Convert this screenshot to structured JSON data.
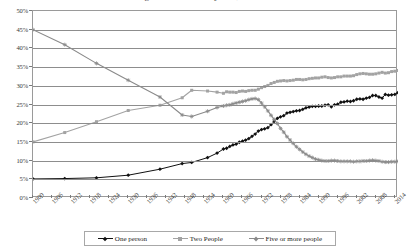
{
  "chart_data": {
    "type": "line",
    "title": "Percentage of Households by Size, United States",
    "xlabel": "",
    "ylabel": "",
    "xlim": [
      1900,
      2015
    ],
    "ylim": [
      0,
      50
    ],
    "grid": true,
    "legend_position": "bottom",
    "y_tick_labels": [
      "0%",
      "5%",
      "10%",
      "15%",
      "20%",
      "25%",
      "30%",
      "35%",
      "40%",
      "45%",
      "50%"
    ],
    "y_tick_values": [
      0,
      5,
      10,
      15,
      20,
      25,
      30,
      35,
      40,
      45,
      50
    ],
    "x_tick_labels": [
      "1900",
      "1906",
      "1912",
      "1918",
      "1924",
      "1930",
      "1936",
      "1942",
      "1948",
      "1954",
      "1960",
      "1966",
      "1972",
      "1978",
      "1984",
      "1990",
      "1996",
      "2002",
      "2008",
      "2014"
    ],
    "x_tick_values": [
      1900,
      1906,
      1912,
      1918,
      1924,
      1930,
      1936,
      1942,
      1948,
      1954,
      1960,
      1966,
      1972,
      1978,
      1984,
      1990,
      1996,
      2002,
      2008,
      2014
    ],
    "series": [
      {
        "name": "One person",
        "color": "#111111",
        "marker": "diamond",
        "x": [
          1900,
          1910,
          1920,
          1930,
          1940,
          1947,
          1950,
          1955,
          1958,
          1960,
          1961,
          1962,
          1963,
          1964,
          1965,
          1966,
          1967,
          1968,
          1969,
          1970,
          1971,
          1972,
          1973,
          1974,
          1975,
          1976,
          1977,
          1978,
          1979,
          1980,
          1981,
          1982,
          1983,
          1984,
          1985,
          1986,
          1987,
          1988,
          1989,
          1990,
          1991,
          1992,
          1993,
          1994,
          1995,
          1996,
          1997,
          1998,
          1999,
          2000,
          2001,
          2002,
          2003,
          2004,
          2005,
          2006,
          2007,
          2008,
          2009,
          2010,
          2011,
          2012,
          2013,
          2014,
          2015
        ],
        "y": [
          5.1,
          5.2,
          5.4,
          6.1,
          7.7,
          9.2,
          9.5,
          10.8,
          12.0,
          13.1,
          13.3,
          13.8,
          14.2,
          14.4,
          14.9,
          15.2,
          15.5,
          15.9,
          16.5,
          17.1,
          17.9,
          18.3,
          18.5,
          18.8,
          19.6,
          20.5,
          21.3,
          21.7,
          22.0,
          22.7,
          22.9,
          23.1,
          23.3,
          23.4,
          23.7,
          24.1,
          24.3,
          24.5,
          24.5,
          24.6,
          24.6,
          24.8,
          24.9,
          24.4,
          24.9,
          25.1,
          25.6,
          25.7,
          25.9,
          25.8,
          26.0,
          26.4,
          26.5,
          26.4,
          26.7,
          26.9,
          27.4,
          27.4,
          27.0,
          26.7,
          27.7,
          27.5,
          27.6,
          27.7,
          28.2
        ],
        "start_value": 5.1,
        "end_value": 28.2
      },
      {
        "name": "Two People",
        "color": "#a3a3a3",
        "marker": "square",
        "x": [
          1900,
          1910,
          1920,
          1930,
          1940,
          1947,
          1950,
          1955,
          1958,
          1960,
          1961,
          1962,
          1963,
          1964,
          1965,
          1966,
          1967,
          1968,
          1969,
          1970,
          1971,
          1972,
          1973,
          1974,
          1975,
          1976,
          1977,
          1978,
          1979,
          1980,
          1981,
          1982,
          1983,
          1984,
          1985,
          1986,
          1987,
          1988,
          1989,
          1990,
          1991,
          1992,
          1993,
          1994,
          1995,
          1996,
          1997,
          1998,
          1999,
          2000,
          2001,
          2002,
          2003,
          2004,
          2005,
          2006,
          2007,
          2008,
          2009,
          2010,
          2011,
          2012,
          2013,
          2014,
          2015
        ],
        "y": [
          15.0,
          17.5,
          20.4,
          23.4,
          24.8,
          26.8,
          28.8,
          28.6,
          28.3,
          28.0,
          28.4,
          28.3,
          28.3,
          28.2,
          28.5,
          28.6,
          28.5,
          28.7,
          28.8,
          28.8,
          29.1,
          29.5,
          29.8,
          30.1,
          30.6,
          30.9,
          31.2,
          31.3,
          31.4,
          31.3,
          31.4,
          31.5,
          31.7,
          31.7,
          31.6,
          31.7,
          31.9,
          32.0,
          32.1,
          32.1,
          32.3,
          32.4,
          32.2,
          32.1,
          32.2,
          32.4,
          32.4,
          32.6,
          32.6,
          32.6,
          32.7,
          33.0,
          33.2,
          33.3,
          33.2,
          33.1,
          33.1,
          33.2,
          33.4,
          33.6,
          33.4,
          33.5,
          33.8,
          33.9,
          34.1
        ],
        "start_value": 15.0,
        "end_value": 34.1
      },
      {
        "name": "Five or more people",
        "color": "#8a8a8a",
        "marker": "star",
        "x": [
          1900,
          1910,
          1920,
          1930,
          1940,
          1947,
          1950,
          1955,
          1958,
          1960,
          1961,
          1962,
          1963,
          1964,
          1965,
          1966,
          1967,
          1968,
          1969,
          1970,
          1971,
          1972,
          1973,
          1974,
          1975,
          1976,
          1977,
          1978,
          1979,
          1980,
          1981,
          1982,
          1983,
          1984,
          1985,
          1986,
          1987,
          1988,
          1989,
          1990,
          1991,
          1992,
          1993,
          1994,
          1995,
          1996,
          1997,
          1998,
          1999,
          2000,
          2001,
          2002,
          2003,
          2004,
          2005,
          2006,
          2007,
          2008,
          2009,
          2010,
          2011,
          2012,
          2013,
          2014,
          2015
        ],
        "y": [
          45.0,
          41.0,
          36.0,
          31.5,
          27.0,
          22.2,
          21.8,
          23.2,
          24.2,
          24.6,
          24.8,
          24.9,
          25.2,
          25.4,
          25.6,
          25.8,
          26.0,
          26.3,
          26.5,
          26.6,
          26.3,
          25.4,
          24.4,
          23.3,
          22.1,
          21.0,
          19.9,
          18.6,
          17.6,
          16.4,
          15.5,
          14.6,
          13.7,
          13.0,
          12.3,
          11.7,
          11.2,
          10.8,
          10.4,
          10.2,
          10.0,
          9.9,
          9.9,
          10.0,
          10.0,
          9.9,
          9.8,
          9.8,
          9.8,
          9.8,
          9.7,
          9.8,
          9.8,
          9.9,
          9.9,
          10.0,
          10.1,
          10.0,
          9.9,
          9.7,
          9.6,
          9.6,
          9.7,
          9.7,
          9.8
        ],
        "start_value": 45.0,
        "end_value": 9.8
      }
    ]
  },
  "legend": {
    "entries": [
      {
        "label": "One person",
        "color": "#111111"
      },
      {
        "label": "Two People",
        "color": "#a3a3a3"
      },
      {
        "label": "Five or more people",
        "color": "#8a8a8a"
      }
    ]
  }
}
